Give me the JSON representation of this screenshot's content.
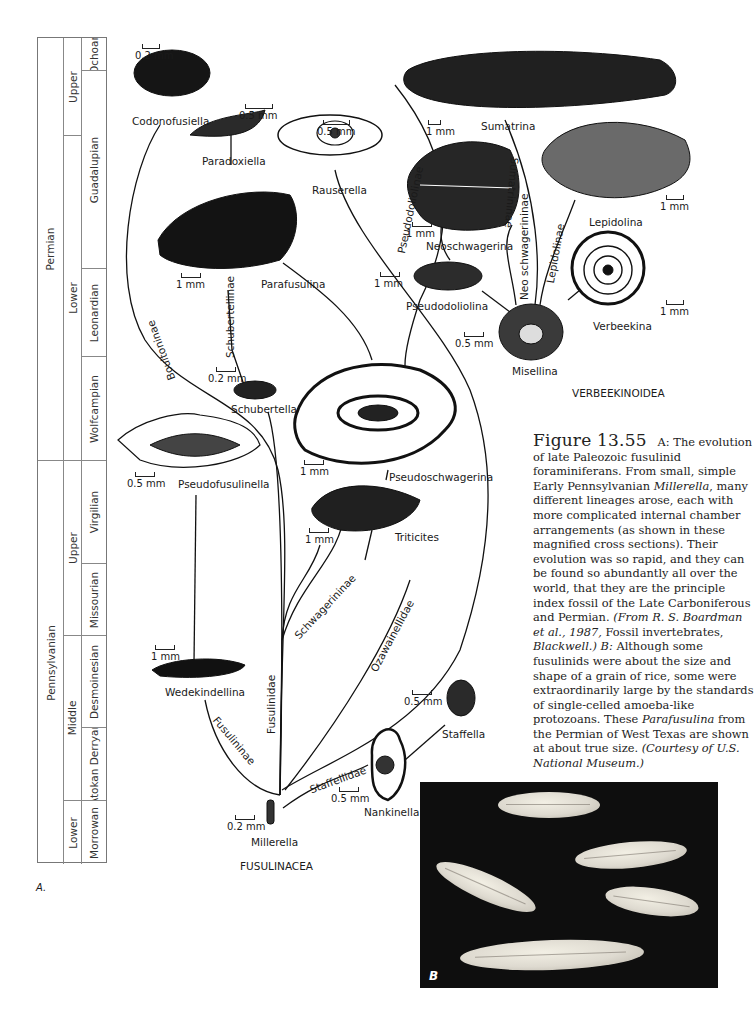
{
  "time_scale": {
    "systems": [
      {
        "name": "Permian",
        "top": 0,
        "height": 423
      },
      {
        "name": "Pennsylvanian",
        "top": 423,
        "height": 403
      }
    ],
    "series": [
      {
        "name": "Upper",
        "top": 0,
        "height": 226
      },
      {
        "name": "Lower",
        "top": 226,
        "height": 197
      },
      {
        "name": "Upper",
        "top": 423,
        "height": 175
      },
      {
        "name": "Middle",
        "top": 598,
        "height": 165
      },
      {
        "name": "Lower",
        "top": 763,
        "height": 63
      }
    ],
    "stages": [
      {
        "name": "Ochoan",
        "top": 0,
        "height": 33
      },
      {
        "name": "Guadalupian",
        "top": 33,
        "height": 198
      },
      {
        "name": "Leonardian",
        "top": 231,
        "height": 88
      },
      {
        "name": "Wolfcampian",
        "top": 319,
        "height": 104
      },
      {
        "name": "Virgilian",
        "top": 423,
        "height": 103
      },
      {
        "name": "Missourian",
        "top": 526,
        "height": 72
      },
      {
        "name": "Desmoinesian",
        "top": 598,
        "height": 92
      },
      {
        "name": "Atokan Derryan",
        "top": 690,
        "height": 73
      },
      {
        "name": "Morrowan",
        "top": 763,
        "height": 63
      }
    ]
  },
  "panel_a_label": "A.",
  "superfamily_labels": {
    "fusulinacea": "FUSULINACEA",
    "verbeekinoidea": "VERBEEKINOIDEA"
  },
  "taxa": [
    {
      "name": "Codonofusiella",
      "scale": "0.2 mm"
    },
    {
      "name": "Paradoxiella",
      "scale": "0.5 mm"
    },
    {
      "name": "Rauserella",
      "scale": "0.5 mm"
    },
    {
      "name": "Sumatrina",
      "scale": "1 mm"
    },
    {
      "name": "Neoschwagerina",
      "scale": "1 mm"
    },
    {
      "name": "Lepidolina",
      "scale": "1 mm"
    },
    {
      "name": "Parafusulina",
      "scale": "1 mm"
    },
    {
      "name": "Pseudodoliolina",
      "scale": "1 mm"
    },
    {
      "name": "Verbeekina",
      "scale": "1 mm"
    },
    {
      "name": "Misellina",
      "scale": "0.5 mm"
    },
    {
      "name": "Schubertella",
      "scale": "0.2 mm"
    },
    {
      "name": "Pseudoschwagerina",
      "scale": "1 mm"
    },
    {
      "name": "Pseudofusulinella",
      "scale": "0.5 mm"
    },
    {
      "name": "Triticites",
      "scale": "1 mm"
    },
    {
      "name": "Wedekindellina",
      "scale": "1 mm"
    },
    {
      "name": "Staffella",
      "scale": "0.5 mm"
    },
    {
      "name": "Nankinella",
      "scale": "0.5 mm"
    },
    {
      "name": "Millerella",
      "scale": "0.2 mm"
    }
  ],
  "lineages": {
    "boultoninae": "Boultoninae",
    "schubertellinae": "Schubertellinae",
    "pseudodoliolinae": "Pseudodoliolinae",
    "sumatrininae": "Sumatrininae",
    "neoschwagerininae": "Neo schwagerininae",
    "lepidolinae": "Lepidolinae",
    "schwagerininae": "Schwagerininae",
    "ozawainellidae": "Ozawainellidae",
    "fusulinidae": "Fusulinidae",
    "fusulininae": "Fusulininae",
    "staffellidae": "Staffellidae"
  },
  "caption": {
    "figure_number": "Figure 13.55",
    "part_a_intro": "A: The evolution of late Paleozoic fusulinid foraminiferans. From small, simple Early Pennsylvanian",
    "millerella": "Millerella",
    "part_a_body": ", many different lineages arose, each with more complicated internal chamber arrangements (as shown in these magnified cross sections). Their evolution was so rapid, and they can be found so abundantly all over the world, that they are the principle index fossil of the Late Carboniferous and Permian.",
    "source_a": "(From R. S. Boardman et al., 1987,",
    "source_a_title": "Fossil invertebrates,",
    "source_a_pub": "Blackwell.)",
    "part_b_label": "B:",
    "part_b_body": "Although some fusulinids were about the size and shape of a grain of rice, some were extraordinarily large by the standards of single-celled amoeba-like protozoans. These",
    "parafusulina": "Parafusulina",
    "part_b_end": "from the Permian of West Texas are shown at about true size.",
    "courtesy": "(Courtesy of U.S. National Museum.)"
  },
  "photo": {
    "label": "B"
  }
}
